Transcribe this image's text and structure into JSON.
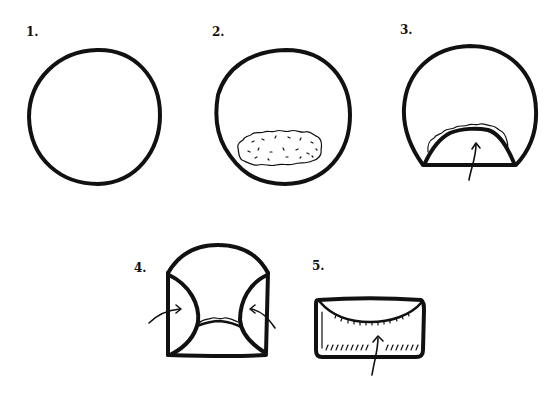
{
  "steps": [
    {
      "number": "1.",
      "description": "Circle of dough"
    },
    {
      "number": "2.",
      "description": "Filling placed near the bottom"
    },
    {
      "number": "3.",
      "description": "Fold bottom edge up over the filling"
    },
    {
      "number": "4.",
      "description": "Fold left and right sides inward"
    },
    {
      "number": "5.",
      "description": "Roll up into a rectangle packet"
    }
  ],
  "colors": {
    "ink": "#111111",
    "background": "#ffffff"
  }
}
